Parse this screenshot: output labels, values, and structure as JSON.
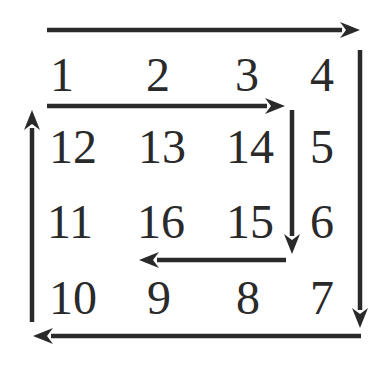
{
  "diagram": {
    "type": "spiral-matrix",
    "rows": [
      [
        "1",
        "2",
        "3",
        "4"
      ],
      [
        "12",
        "13",
        "14",
        "5"
      ],
      [
        "11",
        "16",
        "15",
        "6"
      ],
      [
        "10",
        "9",
        "8",
        "7"
      ]
    ],
    "cells": [
      {
        "label": "1",
        "x": 62,
        "y": 75
      },
      {
        "label": "2",
        "x": 158,
        "y": 75
      },
      {
        "label": "3",
        "x": 247,
        "y": 75
      },
      {
        "label": "4",
        "x": 322,
        "y": 75
      },
      {
        "label": "12",
        "x": 73,
        "y": 147
      },
      {
        "label": "13",
        "x": 162,
        "y": 147
      },
      {
        "label": "14",
        "x": 250,
        "y": 147
      },
      {
        "label": "5",
        "x": 322,
        "y": 147
      },
      {
        "label": "11",
        "x": 70,
        "y": 222
      },
      {
        "label": "16",
        "x": 161,
        "y": 222
      },
      {
        "label": "15",
        "x": 250,
        "y": 222
      },
      {
        "label": "6",
        "x": 322,
        "y": 222
      },
      {
        "label": "10",
        "x": 73,
        "y": 298
      },
      {
        "label": "9",
        "x": 159,
        "y": 298
      },
      {
        "label": "8",
        "x": 248,
        "y": 298
      },
      {
        "label": "7",
        "x": 322,
        "y": 298
      }
    ],
    "arrows": [
      {
        "name": "outer-top-right",
        "x1": 47,
        "y1": 30,
        "x2": 360,
        "y2": 30
      },
      {
        "name": "outer-right-down",
        "x1": 360,
        "y1": 50,
        "x2": 360,
        "y2": 328
      },
      {
        "name": "outer-bottom-left",
        "x1": 361,
        "y1": 336,
        "x2": 33,
        "y2": 336
      },
      {
        "name": "outer-left-up",
        "x1": 32,
        "y1": 322,
        "x2": 32,
        "y2": 110
      },
      {
        "name": "inner-top-right",
        "x1": 47,
        "y1": 106,
        "x2": 285,
        "y2": 106
      },
      {
        "name": "inner-right-down",
        "x1": 292,
        "y1": 110,
        "x2": 292,
        "y2": 254
      },
      {
        "name": "inner-bottom-left",
        "x1": 286,
        "y1": 260,
        "x2": 139,
        "y2": 260
      }
    ],
    "colors": {
      "ink": "#2a2a2a",
      "background": "#ffffff"
    }
  }
}
